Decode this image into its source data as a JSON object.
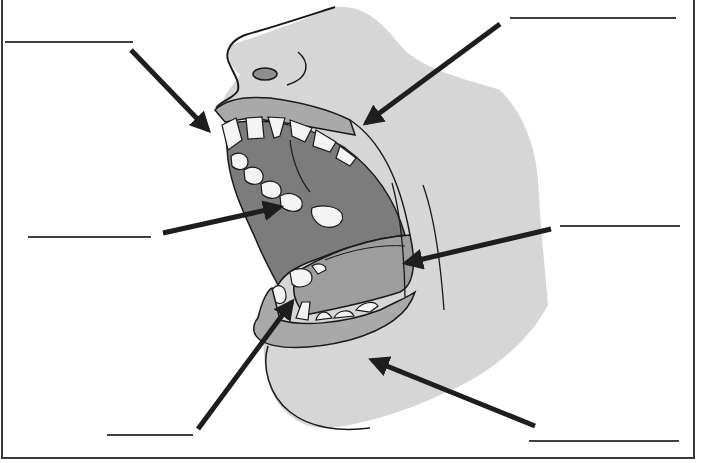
{
  "diagram": {
    "colors": {
      "background": "#ffffff",
      "skin": "#d6d6d6",
      "lip": "#a9a9a9",
      "mouth_interior": "#7c7c7c",
      "tongue": "#9d9d9d",
      "teeth": "#f4f4f4",
      "outline": "#1a1a1a",
      "arrow": "#1e1e1e",
      "label_line": "#3f3f3f",
      "frame": "#3a3a3a"
    },
    "labels": [
      {
        "id": "upper-left",
        "text": "",
        "line": {
          "x1": 5,
          "y1": 42,
          "x2": 133,
          "y2": 42
        },
        "arrow": {
          "x1": 131,
          "y1": 50,
          "x2": 208,
          "y2": 130
        }
      },
      {
        "id": "upper-right",
        "text": "",
        "line": {
          "x1": 510,
          "y1": 18,
          "x2": 676,
          "y2": 18
        },
        "arrow": {
          "x1": 500,
          "y1": 24,
          "x2": 366,
          "y2": 123
        }
      },
      {
        "id": "middle-left",
        "text": "",
        "line": {
          "x1": 28,
          "y1": 237,
          "x2": 151,
          "y2": 237
        },
        "arrow": {
          "x1": 163,
          "y1": 233,
          "x2": 280,
          "y2": 207
        }
      },
      {
        "id": "middle-right",
        "text": "",
        "line": {
          "x1": 560,
          "y1": 226,
          "x2": 680,
          "y2": 226
        },
        "arrow": {
          "x1": 551,
          "y1": 229,
          "x2": 406,
          "y2": 263
        }
      },
      {
        "id": "lower-left",
        "text": "",
        "line": {
          "x1": 107,
          "y1": 435,
          "x2": 193,
          "y2": 435
        },
        "arrow": {
          "x1": 198,
          "y1": 429,
          "x2": 292,
          "y2": 302
        }
      },
      {
        "id": "lower-right",
        "text": "",
        "line": {
          "x1": 529,
          "y1": 441,
          "x2": 679,
          "y2": 441
        },
        "arrow": {
          "x1": 535,
          "y1": 426,
          "x2": 372,
          "y2": 360
        }
      }
    ]
  }
}
